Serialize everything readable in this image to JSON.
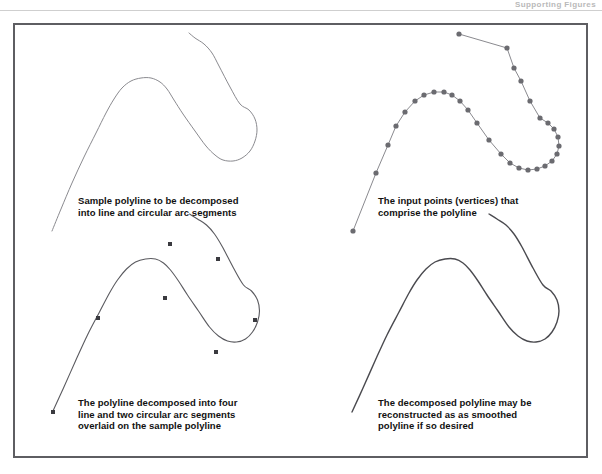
{
  "page": {
    "header_text": "Supporting Figures",
    "background_color": "#ffffff",
    "frame_color": "#5e5e62",
    "rule_color": "#cfcfcf"
  },
  "figure": {
    "panels": [
      {
        "id": "top-left",
        "caption": "Sample polyline to be decomposed\ninto line and circular arc segments",
        "stroke_color": "#8a8a8f",
        "stroke_width": 1,
        "marker": "none",
        "marker_color": "",
        "description": "Sample polyline drawn as a thin grey curve"
      },
      {
        "id": "top-right",
        "caption": "The input points (vertices) that\ncomprise the polyline",
        "stroke_color": "#8a8a8f",
        "stroke_width": 1,
        "marker": "circle",
        "marker_color": "#6b6b70",
        "marker_radius": 2.6,
        "description": "Same polyline shown as straight chords between the input vertices, with each vertex marked by a filled dot"
      },
      {
        "id": "bottom-left",
        "caption": "The polyline decomposed into four\nline and two circular arc segments\noverlaid on the sample polyline",
        "stroke_color": "#5a5a5f",
        "stroke_width": 1.1,
        "marker": "square",
        "marker_color": "#3a3a3f",
        "marker_size": 4,
        "description": "Decomposed polyline with square markers at the segment break points"
      },
      {
        "id": "bottom-right",
        "caption": "The decomposed polyline may be\nreconstructed as as smoothed\npolyline if so desired",
        "stroke_color": "#4a4a4f",
        "stroke_width": 1.4,
        "marker": "none",
        "marker_color": "",
        "description": "Reconstructed smoothed polyline with no markers"
      }
    ]
  },
  "chart_data": {
    "type": "line",
    "xlabel": "",
    "ylabel": "",
    "grid": false,
    "legend": "none",
    "note": "Four panels each depict the same planar polyline geometry; coordinates are in screenshot pixel space (origin top-left).",
    "panels": [
      {
        "name": "top-left",
        "series": [
          {
            "name": "sample-polyline",
            "kind": "smooth-path",
            "points": [
              [
                52,
                231
              ],
              [
                61,
                209
              ],
              [
                72,
                183
              ],
              [
                84,
                157
              ],
              [
                96,
                133
              ],
              [
                106,
                113
              ],
              [
                114,
                99
              ],
              [
                122,
                88
              ],
              [
                131,
                81
              ],
              [
                141,
                78
              ],
              [
                151,
                78
              ],
              [
                160,
                82
              ],
              [
                167,
                89
              ],
              [
                174,
                100
              ],
              [
                183,
                114
              ],
              [
                195,
                131
              ],
              [
                206,
                146
              ],
              [
                215,
                155
              ],
              [
                223,
                160
              ],
              [
                233,
                161
              ],
              [
                242,
                158
              ],
              [
                250,
                151
              ],
              [
                255,
                141
              ],
              [
                257,
                130
              ],
              [
                255,
                119
              ],
              [
                249,
                110
              ],
              [
                240,
                104
              ],
              [
                230,
                87
              ],
              [
                219,
                66
              ],
              [
                212,
                53
              ],
              [
                204,
                44
              ],
              [
                195,
                38
              ],
              [
                189,
                33
              ]
            ]
          }
        ]
      },
      {
        "name": "top-right",
        "series": [
          {
            "name": "input-vertices",
            "kind": "polyline-with-vertices",
            "points": [
              [
                353,
                231
              ],
              [
                376,
                173
              ],
              [
                388,
                145
              ],
              [
                396,
                126
              ],
              [
                405,
                112
              ],
              [
                415,
                101
              ],
              [
                424,
                95
              ],
              [
                434,
                92
              ],
              [
                444,
                92
              ],
              [
                452,
                95
              ],
              [
                460,
                101
              ],
              [
                468,
                110
              ],
              [
                477,
                123
              ],
              [
                489,
                140
              ],
              [
                501,
                154
              ],
              [
                510,
                163
              ],
              [
                519,
                168
              ],
              [
                528,
                170
              ],
              [
                537,
                169
              ],
              [
                545,
                166
              ],
              [
                552,
                161
              ],
              [
                557,
                154
              ],
              [
                559,
                146
              ],
              [
                558,
                137
              ],
              [
                554,
                129
              ],
              [
                548,
                123
              ],
              [
                540,
                118
              ],
              [
                530,
                101
              ],
              [
                521,
                81
              ],
              [
                514,
                68
              ],
              [
                507,
                48
              ],
              [
                459,
                34
              ]
            ],
            "vertex_marker": "circle"
          }
        ]
      },
      {
        "name": "bottom-left",
        "series": [
          {
            "name": "decomposed-polyline",
            "kind": "line-and-arc-segments",
            "segment_breaks": [
              [
                53,
                412
              ],
              [
                98,
                318
              ],
              [
                165,
                298
              ],
              [
                216,
                352
              ],
              [
                255,
                320
              ],
              [
                218,
                259
              ],
              [
                170,
                244
              ]
            ],
            "segments": [
              {
                "type": "line",
                "from": [
                  53,
                  412
                ],
                "to": [
                  98,
                  318
                ]
              },
              {
                "type": "arc",
                "from": [
                  98,
                  318
                ],
                "to": [
                  165,
                  298
                ]
              },
              {
                "type": "line",
                "from": [
                  165,
                  298
                ],
                "to": [
                  216,
                  352
                ]
              },
              {
                "type": "arc",
                "from": [
                  216,
                  352
                ],
                "to": [
                  255,
                  320
                ]
              },
              {
                "type": "line",
                "from": [
                  255,
                  320
                ],
                "to": [
                  218,
                  259
                ]
              },
              {
                "type": "line",
                "from": [
                  218,
                  259
                ],
                "to": [
                  170,
                  244
                ]
              }
            ]
          }
        ]
      },
      {
        "name": "bottom-right",
        "series": [
          {
            "name": "reconstructed-smoothed-polyline",
            "kind": "smooth-path",
            "points": [
              [
                352,
                412
              ],
              [
                363,
                388
              ],
              [
                375,
                361
              ],
              [
                387,
                335
              ],
              [
                399,
                312
              ],
              [
                409,
                293
              ],
              [
                417,
                280
              ],
              [
                426,
                269
              ],
              [
                435,
                262
              ],
              [
                445,
                259
              ],
              [
                455,
                259
              ],
              [
                463,
                263
              ],
              [
                470,
                270
              ],
              [
                478,
                281
              ],
              [
                487,
                295
              ],
              [
                498,
                311
              ],
              [
                509,
                327
              ],
              [
                518,
                336
              ],
              [
                527,
                341
              ],
              [
                536,
                342
              ],
              [
                545,
                339
              ],
              [
                552,
                332
              ],
              [
                557,
                322
              ],
              [
                559,
                311
              ],
              [
                557,
                300
              ],
              [
                551,
                291
              ],
              [
                543,
                285
              ],
              [
                533,
                268
              ],
              [
                522,
                247
              ],
              [
                514,
                234
              ],
              [
                506,
                225
              ],
              [
                497,
                219
              ],
              [
                489,
                214
              ]
            ]
          }
        ]
      }
    ]
  }
}
